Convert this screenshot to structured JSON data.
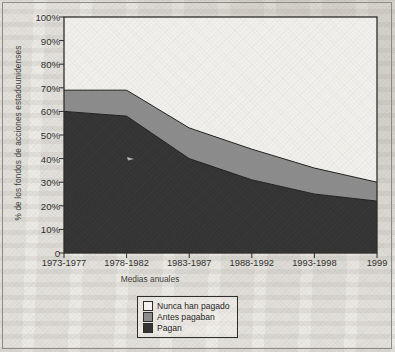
{
  "chart_data": {
    "type": "area",
    "stacked": true,
    "title": "",
    "xlabel": "Medias anuales",
    "ylabel": "% de los fondos de acciones estadounidenses",
    "categories": [
      "1973-1977",
      "1978-1982",
      "1983-1987",
      "1988-1992",
      "1993-1998",
      "1999"
    ],
    "ylim": [
      0,
      100
    ],
    "ytick_labels": [
      "0",
      "10%",
      "20%",
      "30%",
      "40%",
      "50%",
      "60%",
      "70%",
      "80%",
      "90%",
      "100%"
    ],
    "ytick_values": [
      0,
      10,
      20,
      30,
      40,
      50,
      60,
      70,
      80,
      90,
      100
    ],
    "grid": false,
    "legend_position": "bottom-center",
    "series": [
      {
        "name": "Pagan",
        "color": "#333333",
        "values": [
          60,
          58,
          40,
          31,
          25,
          22
        ]
      },
      {
        "name": "Antes pagaban",
        "color": "#8c8c8c",
        "values": [
          9,
          11,
          13,
          13,
          11,
          8
        ]
      },
      {
        "name": "Nunca han pagado",
        "color": "#f2f0ec",
        "values": [
          31,
          31,
          47,
          56,
          64,
          70
        ]
      }
    ],
    "cumulative_tops": {
      "Pagan": [
        60,
        58,
        40,
        31,
        25,
        22
      ],
      "Antes pagaban": [
        69,
        69,
        53,
        44,
        36,
        30
      ],
      "Nunca han pagado": [
        100,
        100,
        100,
        100,
        100,
        100
      ]
    }
  },
  "legend": {
    "items": [
      {
        "label": "Nunca han pagado",
        "color": "#f6f4f0"
      },
      {
        "label": "Antes pagaban",
        "color": "#8c8c8c"
      },
      {
        "label": "Pagan",
        "color": "#333333"
      }
    ]
  },
  "colors": {
    "paid_dark": "#333333",
    "formerly_gray": "#8c8c8c",
    "never_light": "#f2f0ec",
    "axis": "#2b2b29",
    "paper": "#eceae5"
  }
}
